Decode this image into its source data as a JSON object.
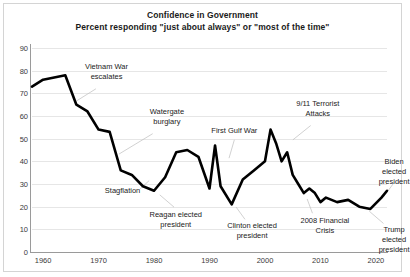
{
  "chart_data": {
    "type": "line",
    "title": "Confidence in Government",
    "subtitle": "Percent responding \"just about always\" or \"most of the time\"",
    "xlabel": "",
    "ylabel": "",
    "xlim": [
      1958,
      2022
    ],
    "ylim": [
      0,
      90
    ],
    "ytick_labels": [
      "0",
      "10",
      "20",
      "30",
      "40",
      "50",
      "60",
      "70",
      "80",
      "90"
    ],
    "ytick_values": [
      0,
      10,
      20,
      30,
      40,
      50,
      60,
      70,
      80,
      90
    ],
    "xtick_labels": [
      "1960",
      "1970",
      "1980",
      "1990",
      "2000",
      "2010",
      "2020"
    ],
    "xtick_values": [
      1960,
      1970,
      1980,
      1990,
      2000,
      2010,
      2020
    ],
    "grid": true,
    "legend": "none",
    "line_color": "#000000",
    "series": [
      {
        "name": "Percent trusting government",
        "x": [
          1958,
          1960,
          1962,
          1964,
          1966,
          1968,
          1970,
          1972,
          1974,
          1976,
          1978,
          1980,
          1982,
          1984,
          1986,
          1988,
          1990,
          1991,
          1992,
          1994,
          1996,
          1998,
          2000,
          2001,
          2002,
          2003,
          2004,
          2005,
          2006,
          2007,
          2008,
          2009,
          2010,
          2011,
          2013,
          2015,
          2017,
          2019,
          2021,
          2022
        ],
        "values": [
          73,
          76,
          77,
          78,
          65,
          62,
          54,
          53,
          36,
          34,
          29,
          27,
          33,
          44,
          45,
          42,
          28,
          47,
          29,
          21,
          32,
          36,
          40,
          54,
          48,
          40,
          44,
          34,
          30,
          26,
          28,
          26,
          22,
          24,
          22,
          23,
          20,
          19,
          24,
          27
        ]
      }
    ],
    "annotations": [
      {
        "id": "vietnam-war",
        "text": "Vietnam War\nescalates",
        "x_pct": 21.0,
        "y_pct": 7.0,
        "leader": {
          "x1_pct": 18.0,
          "y1_pct": 20.0,
          "x2_pct": 12.5,
          "y2_pct": 26.0
        }
      },
      {
        "id": "watergate-burglary",
        "text": "Watergate\nburglary",
        "x_pct": 38.0,
        "y_pct": 29.0,
        "leader": {
          "x1_pct": 34.0,
          "y1_pct": 42.0,
          "x2_pct": 24.5,
          "y2_pct": 52.0
        }
      },
      {
        "id": "stagflation",
        "text": "Stagflation",
        "x_pct": 25.5,
        "y_pct": 67.5,
        "leader": {
          "x1_pct": 30.5,
          "y1_pct": 69.0,
          "x2_pct": 33.0,
          "y2_pct": 65.0
        }
      },
      {
        "id": "reagan-elected",
        "text": "Reagan elected\npresident",
        "x_pct": 40.5,
        "y_pct": 79.5,
        "leader": {
          "x1_pct": 40.0,
          "y1_pct": 78.0,
          "x2_pct": 36.0,
          "y2_pct": 72.0
        }
      },
      {
        "id": "first-gulf-war",
        "text": "First Gulf War",
        "x_pct": 57.0,
        "y_pct": 38.0,
        "leader": {
          "x1_pct": 57.0,
          "y1_pct": 45.0,
          "x2_pct": 55.5,
          "y2_pct": 54.0
        }
      },
      {
        "id": "clinton-elected",
        "text": "Clinton elected\npresident",
        "x_pct": 62.0,
        "y_pct": 85.0,
        "leader": {
          "x1_pct": 60.0,
          "y1_pct": 84.0,
          "x2_pct": 57.5,
          "y2_pct": 78.0
        }
      },
      {
        "id": "nine-eleven-attacks",
        "text": "9/11 Terrorist\nAttacks",
        "x_pct": 80.5,
        "y_pct": 25.0,
        "leader": {
          "x1_pct": 78.5,
          "y1_pct": 38.0,
          "x2_pct": 73.5,
          "y2_pct": 45.0
        }
      },
      {
        "id": "financial-crisis-2008",
        "text": "2008 Financial Crisis",
        "x_pct": 82.5,
        "y_pct": 82.5,
        "leader": {
          "x1_pct": 79.0,
          "y1_pct": 81.0,
          "x2_pct": 77.5,
          "y2_pct": 74.0
        }
      },
      {
        "id": "biden-elected",
        "text": "Biden elected\npresident",
        "x_pct": 102.0,
        "y_pct": 53.5,
        "leader": {
          "x1_pct": 102.0,
          "y1_pct": 66.0,
          "x2_pct": 99.0,
          "y2_pct": 73.0
        }
      },
      {
        "id": "trump-elected",
        "text": "Trump elected\npresident",
        "x_pct": 102.0,
        "y_pct": 87.0,
        "leader": {
          "x1_pct": 99.0,
          "y1_pct": 86.0,
          "x2_pct": 95.0,
          "y2_pct": 80.0
        }
      }
    ]
  }
}
